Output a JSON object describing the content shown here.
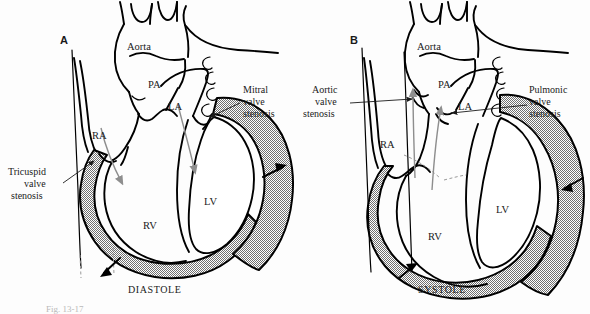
{
  "figure": {
    "caption_partial": "Fig. 13-17",
    "background_color": "#fdfdfd",
    "ink_color": "#000000",
    "myocardium_fill": "#808080",
    "flow_arrow_color": "#8e8e8e"
  },
  "panels": [
    {
      "letter": "A",
      "phase": "DIASTOLE",
      "vessels": [
        {
          "key": "aorta",
          "label": "Aorta"
        },
        {
          "key": "pa",
          "label": "PA"
        }
      ],
      "chambers": [
        {
          "key": "ra",
          "label": "RA"
        },
        {
          "key": "la",
          "label": "LA"
        },
        {
          "key": "rv",
          "label": "RV"
        },
        {
          "key": "lv",
          "label": "LV"
        }
      ],
      "callouts": [
        {
          "key": "tricuspid",
          "lines": [
            "Tricuspid",
            "valve",
            "stenosis"
          ],
          "side": "left"
        },
        {
          "key": "mitral",
          "lines": [
            "Mitral",
            "valve",
            "stenosis"
          ],
          "side": "right"
        }
      ]
    },
    {
      "letter": "B",
      "phase": "SYSTOLE",
      "vessels": [
        {
          "key": "aorta",
          "label": "Aorta"
        },
        {
          "key": "pa",
          "label": "PA"
        }
      ],
      "chambers": [
        {
          "key": "ra",
          "label": "RA"
        },
        {
          "key": "la",
          "label": "LA"
        },
        {
          "key": "rv",
          "label": "RV"
        },
        {
          "key": "lv",
          "label": "LV"
        }
      ],
      "callouts": [
        {
          "key": "aortic",
          "lines": [
            "Aortic",
            "valve",
            "stenosis"
          ],
          "side": "left"
        },
        {
          "key": "pulmonic",
          "lines": [
            "Pulmonic",
            "valve",
            "stenosis"
          ],
          "side": "right"
        }
      ]
    }
  ],
  "panelA": {
    "letter": "A",
    "phase": "DIASTOLE",
    "aorta": "Aorta",
    "pa": "PA",
    "la": "LA",
    "ra": "RA",
    "lv": "LV",
    "rv": "RV",
    "tricuspid_1": "Tricuspid",
    "tricuspid_2": "valve",
    "tricuspid_3": "stenosis",
    "mitral_1": "Mitral",
    "mitral_2": "valve",
    "mitral_3": "stenosis"
  },
  "panelB": {
    "letter": "B",
    "phase": "SYSTOLE",
    "aorta": "Aorta",
    "pa": "PA",
    "la": "LA",
    "ra": "RA",
    "lv": "LV",
    "rv": "RV",
    "aortic_1": "Aortic",
    "aortic_2": "valve",
    "aortic_3": "stenosis",
    "pulmonic_1": "Pulmonic",
    "pulmonic_2": "valve",
    "pulmonic_3": "stenosis"
  },
  "caption": {
    "text": "Fig. 13-17"
  }
}
